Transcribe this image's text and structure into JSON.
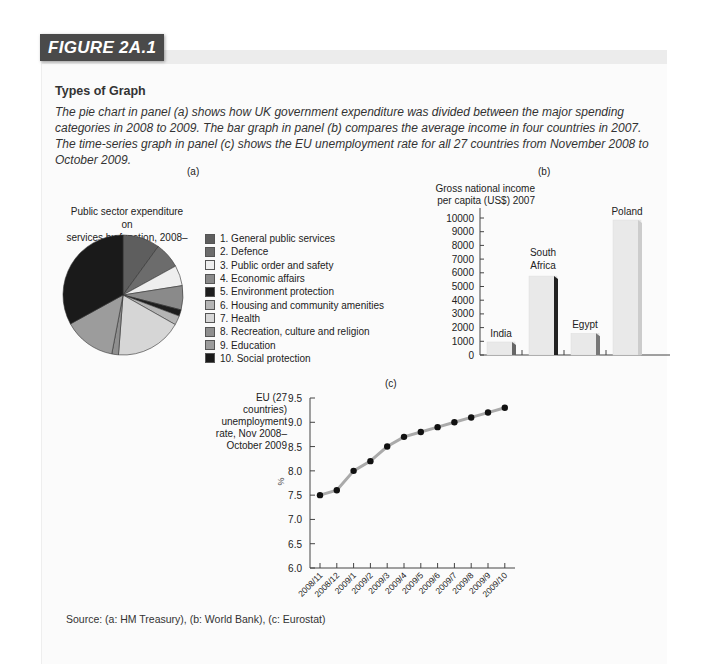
{
  "figure": {
    "badge": "FIGURE 2A.1",
    "title": "Types of Graph",
    "caption": "The pie chart in panel (a) shows how UK government expenditure was divided between the major spending categories in 2008 to 2009. The bar graph in panel (b) compares the average income in four countries in 2007. The time-series graph in panel (c) shows the EU unemployment rate for all 27 countries from November 2008 to October 2009.",
    "source": "Source: (a: HM Treasury), (b: World Bank), (c: Eurostat)"
  },
  "panels": {
    "a": {
      "label": "(a)",
      "title_line1": "Public sector expenditure on",
      "title_line2": "services by function, 2008–09"
    },
    "b": {
      "label": "(b)",
      "ylabel_line1": "Gross national income",
      "ylabel_line2": "per capita (US$) 2007"
    },
    "c": {
      "label": "(c)",
      "ylabel_line1": "EU (27 countries)",
      "ylabel_line2": "unemployment",
      "ylabel_line3": "rate, Nov 2008–",
      "ylabel_line4": "October 2009",
      "unit": "%"
    }
  },
  "chart_data": [
    {
      "type": "pie",
      "title": "Public sector expenditure on services by function, 2008–09",
      "labels": [
        "1. General public services",
        "2. Defence",
        "3. Public order and safety",
        "4. Economic affairs",
        "5. Environment protection",
        "6. Housing and community amenities",
        "7. Health",
        "8. Recreation, culture and religion",
        "9. Education",
        "10. Social protection"
      ],
      "values": [
        10,
        7,
        5.5,
        6.5,
        1.7,
        2.5,
        18,
        1.8,
        14,
        33
      ],
      "colors": [
        "#5e5e5e",
        "#6c6c6c",
        "#eeeeee",
        "#8a8a8a",
        "#1e1e1e",
        "#b5b5b5",
        "#d6d6d6",
        "#8f8f8f",
        "#9c9c9c",
        "#1a1a1a"
      ],
      "legend_position": "right"
    },
    {
      "type": "bar",
      "title": "",
      "categories": [
        "India",
        "South Africa",
        "Egypt",
        "Poland"
      ],
      "values": [
        950,
        5760,
        1580,
        9850
      ],
      "xlabel": "",
      "ylabel": "Gross national income per capita (US$) 2007",
      "ylim": [
        0,
        10000
      ],
      "yticks": [
        0,
        1000,
        2000,
        3000,
        4000,
        5000,
        6000,
        7000,
        8000,
        9000,
        10000
      ],
      "ytick_labels": [
        "0",
        "1000",
        "2000",
        "3000",
        "4000",
        "5000",
        "6000",
        "7000",
        "8000",
        "9000",
        "10000"
      ],
      "grid": false
    },
    {
      "type": "line",
      "title": "",
      "x": [
        "2008/11",
        "2008/12",
        "2009/1",
        "2009/2",
        "2009/3",
        "2009/4",
        "2009/5",
        "2009/6",
        "2009/7",
        "2009/8",
        "2009/9",
        "2009/10"
      ],
      "series": [
        {
          "name": "EU (27 countries) unemployment rate",
          "values": [
            7.5,
            7.6,
            8.0,
            8.2,
            8.5,
            8.7,
            8.8,
            8.9,
            9.0,
            9.1,
            9.2,
            9.3
          ]
        }
      ],
      "xlabel": "",
      "ylabel": "%",
      "ylim": [
        6.0,
        9.5
      ],
      "yticks": [
        "6.0",
        "6.5",
        "7.0",
        "7.5",
        "8.0",
        "8.5",
        "9.0",
        "9.5"
      ],
      "grid": false
    }
  ]
}
